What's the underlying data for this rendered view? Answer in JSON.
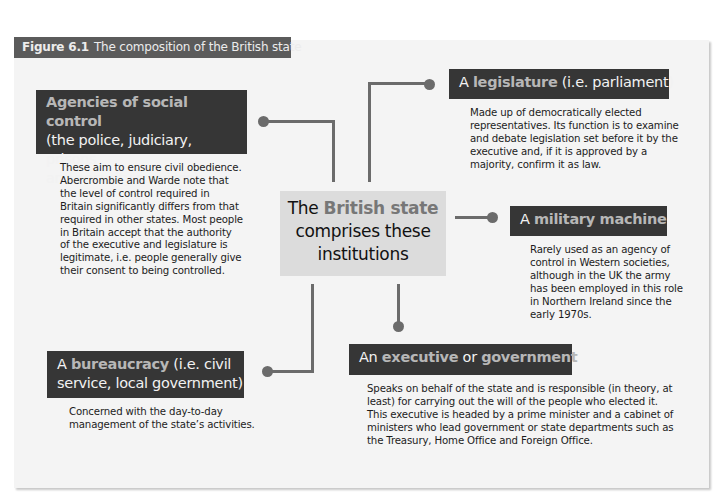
{
  "figure": {
    "number": "Figure 6.1",
    "title": "The composition of the British state"
  },
  "center": {
    "line1_pre": "The ",
    "line1_highlight": "British state",
    "line2": "comprises these",
    "line3": "institutions"
  },
  "agencies": {
    "highlight": "Agencies of social control",
    "rest_line1": "(the police, judiciary, prisons",
    "rest_line2": "and security services)",
    "description": [
      "These aim to ensure civil obedience.",
      "Abercrombie and Warde note that",
      "the level of control required in",
      "Britain significantly differs from that",
      "required in other states. Most people",
      "in Britain accept that the authority",
      "of the executive and legislature is",
      "legitimate, i.e. people generally give",
      "their consent to being controlled."
    ]
  },
  "legislature": {
    "pre": "A ",
    "highlight": "legislature",
    "post": " (i.e. parliament)",
    "description": [
      "Made up of democratically elected",
      "representatives. Its function is to examine",
      "and debate legislation set before it by the",
      "executive and, if it is approved by a",
      "majority, confirm it as law."
    ]
  },
  "military": {
    "pre": "A ",
    "highlight": "military machine",
    "description": [
      "Rarely used as an agency of",
      "control in Western societies,",
      "although in the UK the army",
      "has been employed in this role",
      "in Northern Ireland since the",
      "early 1970s."
    ]
  },
  "bureaucracy": {
    "pre": "A ",
    "highlight": "bureaucracy",
    "post_line1": " (i.e. civil",
    "line2": "service, local government)",
    "description": [
      "Concerned with the day-to-day",
      "management of the state’s activities."
    ]
  },
  "executive": {
    "pre": "An ",
    "highlight1": "executive",
    "mid": " or ",
    "highlight2": "government",
    "description": [
      "Speaks on behalf of the state and is responsible (in theory, at",
      "least) for carrying out the will of the people who elected it.",
      "This executive is headed by a prime minister and a cabinet of",
      "ministers who lead government or state departments such as",
      "the Treasury, Home Office and Foreign Office."
    ]
  },
  "colors": {
    "header_bg": "#363636",
    "highlight_text": "#b7b7b7",
    "center_bg": "#dcdcdc",
    "connector": "#6b6b6b",
    "panel_bg": "#f4f4f4"
  }
}
